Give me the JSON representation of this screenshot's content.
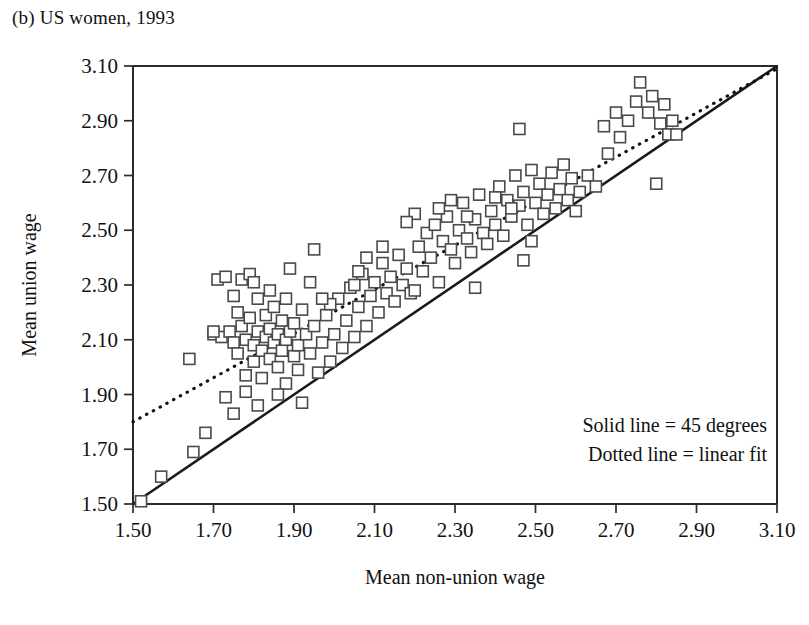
{
  "panel": {
    "title": "(b) US women, 1993"
  },
  "chart_data": {
    "type": "scatter",
    "title": "(b) US women, 1993",
    "xlabel": "Mean non-union wage",
    "ylabel": "Mean union wage",
    "xlim": [
      1.5,
      3.1
    ],
    "ylim": [
      1.5,
      3.1
    ],
    "xticks": [
      "1.50",
      "1.70",
      "1.90",
      "2.10",
      "2.30",
      "2.50",
      "2.70",
      "2.90",
      "3.10"
    ],
    "yticks": [
      "1.50",
      "1.70",
      "1.90",
      "2.10",
      "2.30",
      "2.50",
      "2.70",
      "2.90",
      "3.10"
    ],
    "tick_step": 0.2,
    "grid": false,
    "marker": "open-square",
    "marker_size_px": 11,
    "legend_position": "bottom-right",
    "legend_entries": [
      "Solid line = 45 degrees",
      "Dotted line = linear fit"
    ],
    "lines": [
      {
        "name": "Solid line = 45 degrees",
        "style": "solid",
        "x": [
          1.5,
          3.1
        ],
        "y": [
          1.5,
          3.1
        ]
      },
      {
        "name": "Dotted line = linear fit",
        "style": "dotted",
        "x": [
          1.5,
          3.1
        ],
        "y": [
          1.8,
          3.09
        ],
        "slope": 0.806,
        "intercept": 0.591
      }
    ],
    "points": [
      [
        1.52,
        1.51
      ],
      [
        1.57,
        1.6
      ],
      [
        1.64,
        2.03
      ],
      [
        1.65,
        1.69
      ],
      [
        1.68,
        1.76
      ],
      [
        1.7,
        2.12
      ],
      [
        1.71,
        2.32
      ],
      [
        1.72,
        2.11
      ],
      [
        1.73,
        2.33
      ],
      [
        1.74,
        2.13
      ],
      [
        1.75,
        2.26
      ],
      [
        1.75,
        2.09
      ],
      [
        1.76,
        2.2
      ],
      [
        1.76,
        2.05
      ],
      [
        1.77,
        2.32
      ],
      [
        1.77,
        2.15
      ],
      [
        1.78,
        2.1
      ],
      [
        1.78,
        1.97
      ],
      [
        1.79,
        2.34
      ],
      [
        1.79,
        2.18
      ],
      [
        1.8,
        2.08
      ],
      [
        1.8,
        2.02
      ],
      [
        1.81,
        2.13
      ],
      [
        1.81,
        2.25
      ],
      [
        1.82,
        2.06
      ],
      [
        1.82,
        1.96
      ],
      [
        1.83,
        2.11
      ],
      [
        1.83,
        2.19
      ],
      [
        1.84,
        2.03
      ],
      [
        1.84,
        2.14
      ],
      [
        1.85,
        2.09
      ],
      [
        1.85,
        2.22
      ],
      [
        1.86,
        2.0
      ],
      [
        1.86,
        2.12
      ],
      [
        1.87,
        2.17
      ],
      [
        1.87,
        2.06
      ],
      [
        1.88,
        2.1
      ],
      [
        1.88,
        1.94
      ],
      [
        1.89,
        2.36
      ],
      [
        1.89,
        2.13
      ],
      [
        1.9,
        2.04
      ],
      [
        1.9,
        2.16
      ],
      [
        1.91,
        1.99
      ],
      [
        1.91,
        2.08
      ],
      [
        1.92,
        2.21
      ],
      [
        1.92,
        1.87
      ],
      [
        1.93,
        2.12
      ],
      [
        1.94,
        2.05
      ],
      [
        1.95,
        2.43
      ],
      [
        1.95,
        2.15
      ],
      [
        1.96,
        1.98
      ],
      [
        1.97,
        2.09
      ],
      [
        1.98,
        2.19
      ],
      [
        1.99,
        2.02
      ],
      [
        2.0,
        2.12
      ],
      [
        2.01,
        2.25
      ],
      [
        2.02,
        2.07
      ],
      [
        2.03,
        2.17
      ],
      [
        2.04,
        2.29
      ],
      [
        2.05,
        2.11
      ],
      [
        2.06,
        2.22
      ],
      [
        2.07,
        2.34
      ],
      [
        2.08,
        2.15
      ],
      [
        2.09,
        2.26
      ],
      [
        2.1,
        2.31
      ],
      [
        2.11,
        2.2
      ],
      [
        2.12,
        2.38
      ],
      [
        2.13,
        2.27
      ],
      [
        2.14,
        2.33
      ],
      [
        2.15,
        2.24
      ],
      [
        2.16,
        2.41
      ],
      [
        2.17,
        2.3
      ],
      [
        2.18,
        2.36
      ],
      [
        2.19,
        2.27
      ],
      [
        2.2,
        2.56
      ],
      [
        2.21,
        2.44
      ],
      [
        2.22,
        2.35
      ],
      [
        2.23,
        2.49
      ],
      [
        2.24,
        2.4
      ],
      [
        2.25,
        2.52
      ],
      [
        2.26,
        2.31
      ],
      [
        2.27,
        2.46
      ],
      [
        2.28,
        2.55
      ],
      [
        2.29,
        2.43
      ],
      [
        2.3,
        2.38
      ],
      [
        2.31,
        2.5
      ],
      [
        2.32,
        2.6
      ],
      [
        2.33,
        2.47
      ],
      [
        2.34,
        2.42
      ],
      [
        2.35,
        2.54
      ],
      [
        2.36,
        2.63
      ],
      [
        2.37,
        2.49
      ],
      [
        2.38,
        2.45
      ],
      [
        2.39,
        2.57
      ],
      [
        2.4,
        2.52
      ],
      [
        2.41,
        2.66
      ],
      [
        2.42,
        2.48
      ],
      [
        2.43,
        2.61
      ],
      [
        2.44,
        2.55
      ],
      [
        2.45,
        2.7
      ],
      [
        2.46,
        2.87
      ],
      [
        2.46,
        2.59
      ],
      [
        2.47,
        2.39
      ],
      [
        2.47,
        2.64
      ],
      [
        2.48,
        2.52
      ],
      [
        2.49,
        2.72
      ],
      [
        2.49,
        2.46
      ],
      [
        2.5,
        2.6
      ],
      [
        2.51,
        2.67
      ],
      [
        2.52,
        2.56
      ],
      [
        2.53,
        2.63
      ],
      [
        2.54,
        2.71
      ],
      [
        2.55,
        2.58
      ],
      [
        2.56,
        2.65
      ],
      [
        2.57,
        2.74
      ],
      [
        2.58,
        2.61
      ],
      [
        2.59,
        2.69
      ],
      [
        2.6,
        2.57
      ],
      [
        2.61,
        2.64
      ],
      [
        2.63,
        2.7
      ],
      [
        2.65,
        2.66
      ],
      [
        2.67,
        2.88
      ],
      [
        2.68,
        2.78
      ],
      [
        2.7,
        2.93
      ],
      [
        2.71,
        2.84
      ],
      [
        2.73,
        2.9
      ],
      [
        2.75,
        2.97
      ],
      [
        2.76,
        3.04
      ],
      [
        2.78,
        2.93
      ],
      [
        2.79,
        2.99
      ],
      [
        2.8,
        2.67
      ],
      [
        2.81,
        2.89
      ],
      [
        2.82,
        2.96
      ],
      [
        2.83,
        2.85
      ],
      [
        2.84,
        2.9
      ],
      [
        2.85,
        2.85
      ],
      [
        2.2,
        2.28
      ],
      [
        2.08,
        2.4
      ],
      [
        1.99,
        2.23
      ],
      [
        2.05,
        2.3
      ],
      [
        1.94,
        2.31
      ],
      [
        1.86,
        1.9
      ],
      [
        1.81,
        1.86
      ],
      [
        1.78,
        1.91
      ],
      [
        1.73,
        1.89
      ],
      [
        1.75,
        1.83
      ],
      [
        2.12,
        2.44
      ],
      [
        2.26,
        2.58
      ],
      [
        2.35,
        2.29
      ],
      [
        2.44,
        2.58
      ],
      [
        2.4,
        2.62
      ],
      [
        2.33,
        2.55
      ],
      [
        2.29,
        2.61
      ],
      [
        2.18,
        2.53
      ],
      [
        2.06,
        2.35
      ],
      [
        1.97,
        2.25
      ],
      [
        1.88,
        2.25
      ],
      [
        1.84,
        2.28
      ],
      [
        1.8,
        2.31
      ],
      [
        1.7,
        2.13
      ]
    ]
  }
}
